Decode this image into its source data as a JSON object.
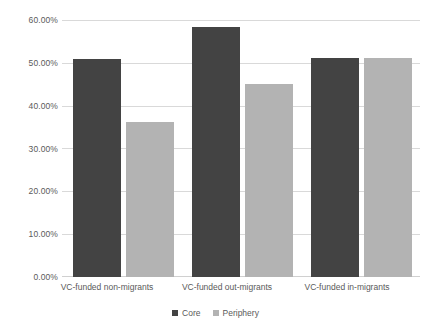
{
  "chart_data": {
    "type": "bar",
    "title": "",
    "subtitle": "",
    "xlabel": "",
    "ylabel": "",
    "categories": [
      "VC-funded non-migrants",
      "VC-funded out-migrants",
      "VC-funded in-migrants"
    ],
    "series": [
      {
        "name": "Core",
        "color": "#434343",
        "values": [
          51.0,
          58.3,
          51.2
        ]
      },
      {
        "name": "Periphery",
        "color": "#b3b3b3",
        "values": [
          36.3,
          45.1,
          51.2
        ]
      }
    ],
    "ylim": [
      0,
      60
    ],
    "ytick_values": [
      0,
      10,
      20,
      30,
      40,
      50,
      60
    ],
    "ytick_labels": [
      "0.00%",
      "10.00%",
      "20.00%",
      "30.00%",
      "40.00%",
      "50.00%",
      "60.00%"
    ],
    "grid": true,
    "legend_position": "bottom",
    "annotations": []
  },
  "axis": {
    "y_labels": [
      "60.00%",
      "50.00%",
      "40.00%",
      "30.00%",
      "20.00%",
      "10.00%",
      "0.00%"
    ],
    "x_labels": [
      "VC-funded non-migrants",
      "VC-funded out-migrants",
      "VC-funded in-migrants"
    ]
  },
  "legend": {
    "items": [
      {
        "label": "Core",
        "color": "#434343"
      },
      {
        "label": "Periphery",
        "color": "#b3b3b3"
      }
    ]
  },
  "colors": {
    "core": "#434343",
    "periphery": "#b3b3b3",
    "gridline": "#d9d9d9",
    "text": "#5a5a5a",
    "background": "#ffffff"
  }
}
